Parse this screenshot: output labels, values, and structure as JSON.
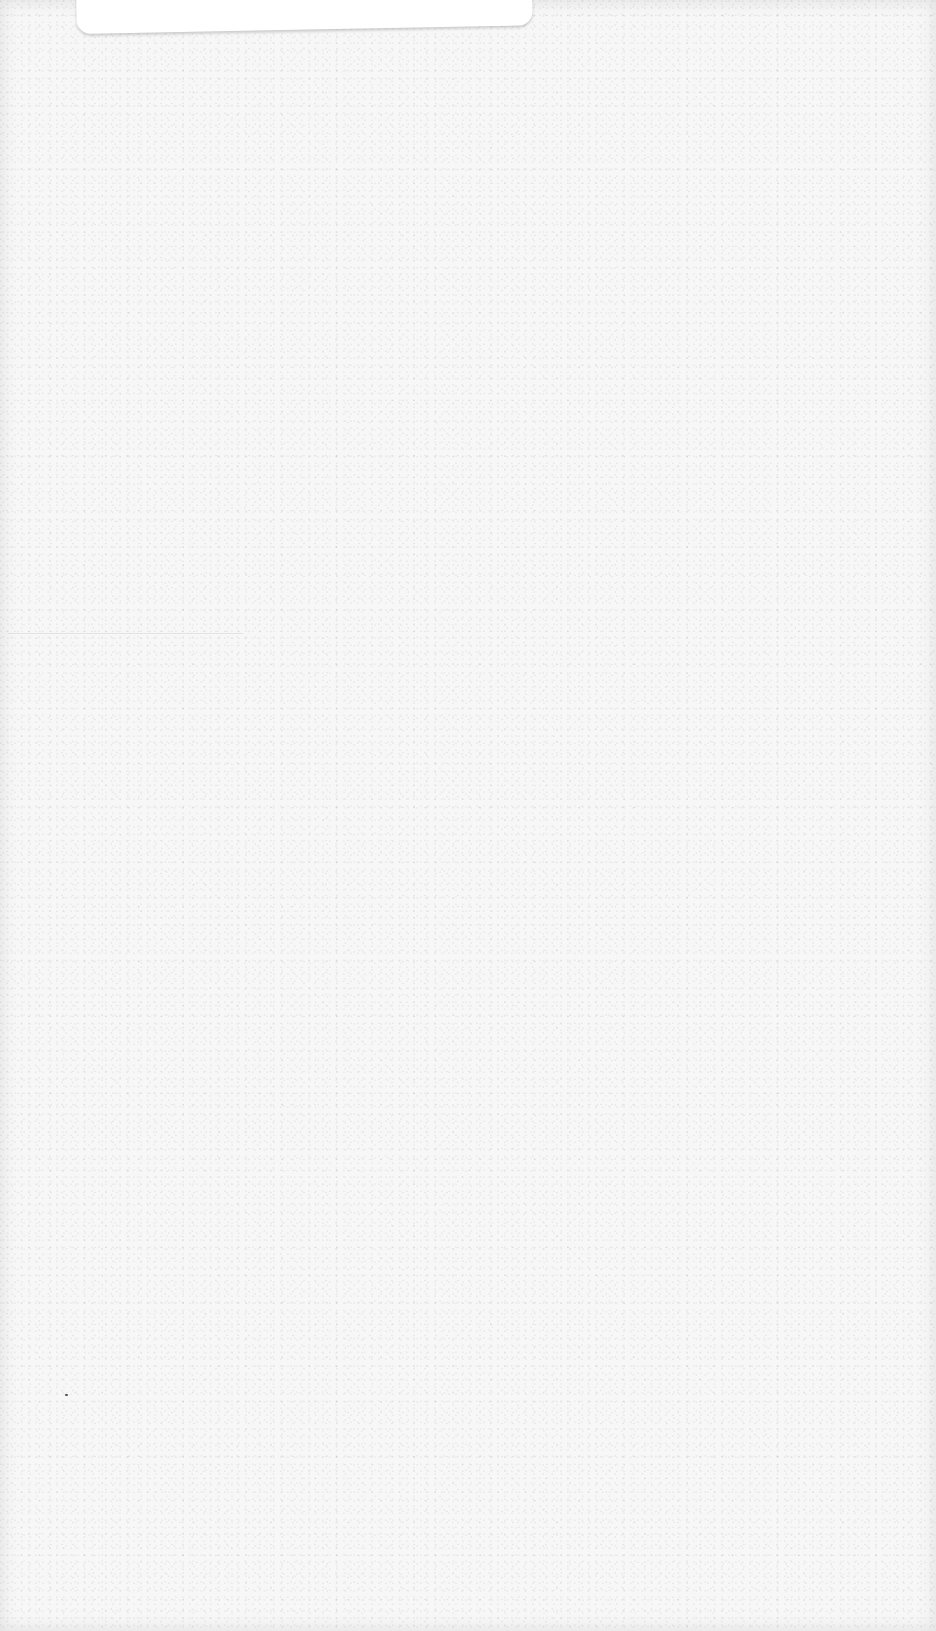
{
  "page": {
    "background_color": "#f7f7f7",
    "card_color": "#ffffff"
  },
  "card": {
    "text": ""
  }
}
